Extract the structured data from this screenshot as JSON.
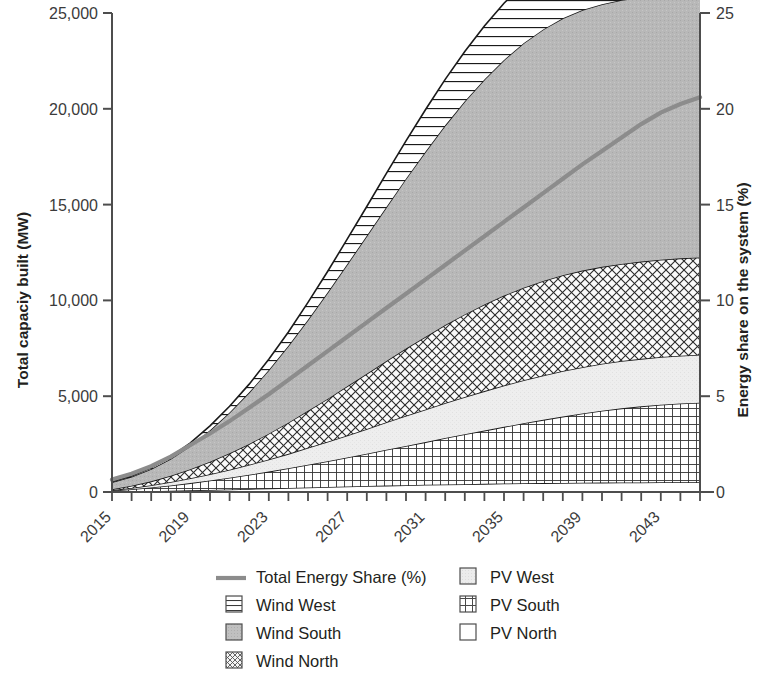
{
  "chart_data": {
    "type": "area",
    "title": "",
    "subtitle": "",
    "xlabel": "",
    "ylabel": "Total capaciy built (MW)",
    "y2label": "Energy share on the system (%)",
    "grid": false,
    "legend_position": "bottom",
    "xlim": [
      2015,
      2045
    ],
    "ylim": [
      0,
      25000
    ],
    "y2lim": [
      0,
      25
    ],
    "x_tick_labels": [
      "2015",
      "2019",
      "2023",
      "2027",
      "2031",
      "2035",
      "2039",
      "2043"
    ],
    "x_tick_values": [
      2015,
      2019,
      2023,
      2027,
      2031,
      2035,
      2039,
      2043
    ],
    "x_minor_tick_interval": 1,
    "y_tick_labels": [
      "0",
      "5,000",
      "10,000",
      "15,000",
      "20,000",
      "25,000"
    ],
    "y_tick_values": [
      0,
      5000,
      10000,
      15000,
      20000,
      25000
    ],
    "y2_tick_labels": [
      "0",
      "5",
      "10",
      "15",
      "20",
      "25"
    ],
    "y2_tick_values": [
      0,
      5,
      10,
      15,
      20,
      25
    ],
    "x": [
      2015,
      2016,
      2017,
      2018,
      2019,
      2020,
      2021,
      2022,
      2023,
      2024,
      2025,
      2026,
      2027,
      2028,
      2029,
      2030,
      2031,
      2032,
      2033,
      2034,
      2035,
      2036,
      2037,
      2038,
      2039,
      2040,
      2041,
      2042,
      2043,
      2044,
      2045
    ],
    "stack_order_bottom_to_top": [
      "PV North",
      "PV South",
      "PV West",
      "Wind North",
      "Wind South",
      "Wind West"
    ],
    "series": [
      {
        "name": "PV North",
        "pattern": "blank",
        "values": [
          10,
          25,
          45,
          65,
          85,
          110,
          135,
          160,
          185,
          210,
          235,
          260,
          285,
          310,
          335,
          355,
          375,
          395,
          410,
          425,
          440,
          455,
          465,
          475,
          485,
          490,
          495,
          500,
          505,
          508,
          510
        ]
      },
      {
        "name": "PV South",
        "pattern": "fine-grid",
        "values": [
          60,
          120,
          190,
          280,
          380,
          490,
          610,
          740,
          880,
          1030,
          1190,
          1350,
          1520,
          1690,
          1870,
          2050,
          2230,
          2420,
          2600,
          2780,
          2960,
          3130,
          3300,
          3460,
          3610,
          3750,
          3870,
          3970,
          4050,
          4110,
          4150
        ]
      },
      {
        "name": "PV West",
        "pattern": "light-stipple",
        "values": [
          30,
          70,
          120,
          180,
          250,
          330,
          420,
          520,
          630,
          750,
          880,
          1010,
          1150,
          1290,
          1430,
          1570,
          1700,
          1830,
          1950,
          2060,
          2160,
          2250,
          2320,
          2380,
          2420,
          2450,
          2470,
          2480,
          2490,
          2495,
          2500
        ]
      },
      {
        "name": "Wind North",
        "pattern": "crosshatch",
        "values": [
          40,
          110,
          200,
          320,
          470,
          650,
          860,
          1090,
          1350,
          1630,
          1930,
          2240,
          2560,
          2880,
          3200,
          3510,
          3800,
          4070,
          4310,
          4520,
          4690,
          4830,
          4930,
          5000,
          5040,
          5060,
          5070,
          5075,
          5080,
          5082,
          5085
        ]
      },
      {
        "name": "Wind South",
        "pattern": "gray-fill",
        "values": [
          370,
          470,
          640,
          890,
          1220,
          1640,
          2130,
          2690,
          3320,
          4010,
          4760,
          5550,
          6370,
          7200,
          8040,
          8870,
          9670,
          10420,
          11120,
          11750,
          12300,
          12760,
          13130,
          13410,
          13600,
          13710,
          13770,
          13800,
          13820,
          13830,
          13840
        ]
      },
      {
        "name": "Wind West",
        "pattern": "horizontal-lines",
        "values": [
          20,
          40,
          70,
          110,
          160,
          230,
          320,
          430,
          560,
          720,
          900,
          1100,
          1310,
          1530,
          1750,
          1970,
          2190,
          2400,
          2600,
          2790,
          2960,
          3110,
          3240,
          3350,
          3430,
          3480,
          3510,
          3530,
          3545,
          3555,
          3560
        ]
      }
    ],
    "line_series": {
      "name": "Total Energy Share (%)",
      "color": "#8c8c8c",
      "axis": "right",
      "unit": "%",
      "values": [
        0.65,
        0.95,
        1.35,
        1.85,
        2.45,
        3.05,
        3.7,
        4.4,
        5.1,
        5.85,
        6.6,
        7.35,
        8.1,
        8.85,
        9.6,
        10.35,
        11.1,
        11.85,
        12.6,
        13.35,
        14.1,
        14.85,
        15.6,
        16.35,
        17.1,
        17.8,
        18.5,
        19.2,
        19.8,
        20.25,
        20.6
      ]
    },
    "legend": [
      {
        "label": "Total Energy Share (%)",
        "swatch": "line",
        "color": "#8c8c8c"
      },
      {
        "label": "PV West",
        "swatch": "light-stipple",
        "color": "#e8e8e8"
      },
      {
        "label": "Wind West",
        "swatch": "horizontal-lines",
        "color": "#ffffff"
      },
      {
        "label": "PV South",
        "swatch": "fine-grid",
        "color": "#ffffff"
      },
      {
        "label": "Wind South",
        "swatch": "gray-fill",
        "color": "#b3b3b3"
      },
      {
        "label": "PV North",
        "swatch": "blank",
        "color": "#ffffff"
      },
      {
        "label": "Wind North",
        "swatch": "crosshatch",
        "color": "#ffffff"
      }
    ]
  },
  "axes": {
    "left_title": "Total capaciy built (MW)",
    "right_title": "Energy share on the system (%)"
  },
  "legend_items": {
    "total_energy_share": "Total Energy Share (%)",
    "wind_west": "Wind West",
    "wind_south": "Wind South",
    "wind_north": "Wind North",
    "pv_west": "PV West",
    "pv_south": "PV South",
    "pv_north": "PV North"
  }
}
